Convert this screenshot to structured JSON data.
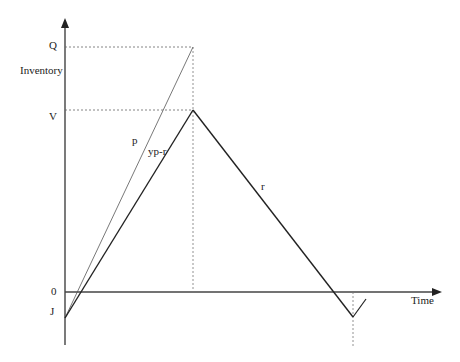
{
  "diagram": {
    "y_axis_label": "Inventory",
    "x_axis_label": "Time",
    "levels": {
      "Q": "Q",
      "V": "V",
      "zero": "0",
      "J": "J"
    },
    "line_labels": {
      "production_rate": "p",
      "net_buildup": "yp-r",
      "demand_rate": "r"
    }
  }
}
